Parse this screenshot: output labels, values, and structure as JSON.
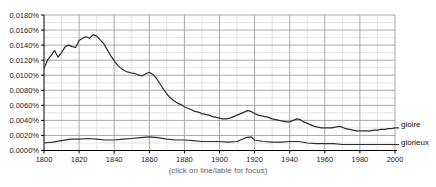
{
  "caption": "(click on line/lable for focus)",
  "chart_data": {
    "type": "line",
    "title": "",
    "xlabel": "",
    "ylabel": "",
    "legend_position": "right-of-lines",
    "grid": "major-and-minor",
    "x_axis": {
      "min": 1800,
      "max": 2000,
      "major_step": 20,
      "minor_step": 10,
      "tick_labels": [
        "1800",
        "1820",
        "1840",
        "1860",
        "1880",
        "1900",
        "1920",
        "1940",
        "1960",
        "1980",
        "2000"
      ]
    },
    "y_axis": {
      "min": 0.0,
      "max": 0.018,
      "major_step": 0.002,
      "minor_step": 0.001,
      "unit": "%",
      "tick_labels": [
        "0.0000%",
        "0.0020%",
        "0.0040%",
        "0.0060%",
        "0.0080%",
        "0.0100%",
        "0.0120%",
        "0.0140%",
        "0.0160%",
        "0.0180%"
      ]
    },
    "colors": {
      "line": "#2e2e2e",
      "major_grid": "#a8a8a8",
      "minor_grid": "#e4e4e4",
      "axis": "#000000",
      "tick_text": "#1a1a1a",
      "caption_text": "#666666"
    },
    "series": [
      {
        "name": "gloire",
        "points": [
          [
            1800,
            0.0109
          ],
          [
            1802,
            0.012
          ],
          [
            1804,
            0.0126
          ],
          [
            1806,
            0.0133
          ],
          [
            1808,
            0.0124
          ],
          [
            1810,
            0.013
          ],
          [
            1812,
            0.0138
          ],
          [
            1814,
            0.014
          ],
          [
            1816,
            0.0138
          ],
          [
            1818,
            0.0137
          ],
          [
            1820,
            0.0146
          ],
          [
            1822,
            0.0149
          ],
          [
            1824,
            0.0151
          ],
          [
            1826,
            0.0149
          ],
          [
            1828,
            0.0154
          ],
          [
            1830,
            0.0152
          ],
          [
            1832,
            0.0147
          ],
          [
            1834,
            0.0142
          ],
          [
            1836,
            0.0134
          ],
          [
            1838,
            0.0126
          ],
          [
            1840,
            0.0119
          ],
          [
            1842,
            0.0113
          ],
          [
            1844,
            0.0109
          ],
          [
            1846,
            0.0106
          ],
          [
            1848,
            0.0104
          ],
          [
            1850,
            0.0103
          ],
          [
            1852,
            0.0102
          ],
          [
            1854,
            0.01
          ],
          [
            1856,
            0.0099
          ],
          [
            1858,
            0.0102
          ],
          [
            1860,
            0.0104
          ],
          [
            1862,
            0.0101
          ],
          [
            1864,
            0.0096
          ],
          [
            1866,
            0.0089
          ],
          [
            1868,
            0.0082
          ],
          [
            1870,
            0.0075
          ],
          [
            1872,
            0.007
          ],
          [
            1874,
            0.0066
          ],
          [
            1876,
            0.0063
          ],
          [
            1878,
            0.0061
          ],
          [
            1880,
            0.0058
          ],
          [
            1882,
            0.0056
          ],
          [
            1884,
            0.0054
          ],
          [
            1886,
            0.0052
          ],
          [
            1888,
            0.0051
          ],
          [
            1890,
            0.0049
          ],
          [
            1892,
            0.0048
          ],
          [
            1894,
            0.0047
          ],
          [
            1896,
            0.0045
          ],
          [
            1898,
            0.0044
          ],
          [
            1900,
            0.0043
          ],
          [
            1902,
            0.0042
          ],
          [
            1904,
            0.0042
          ],
          [
            1906,
            0.0043
          ],
          [
            1908,
            0.0045
          ],
          [
            1910,
            0.0047
          ],
          [
            1912,
            0.0049
          ],
          [
            1914,
            0.0051
          ],
          [
            1916,
            0.0053
          ],
          [
            1918,
            0.0052
          ],
          [
            1920,
            0.0049
          ],
          [
            1922,
            0.0047
          ],
          [
            1924,
            0.0046
          ],
          [
            1926,
            0.0045
          ],
          [
            1928,
            0.0044
          ],
          [
            1930,
            0.0042
          ],
          [
            1932,
            0.0041
          ],
          [
            1934,
            0.004
          ],
          [
            1936,
            0.0039
          ],
          [
            1938,
            0.0038
          ],
          [
            1940,
            0.0038
          ],
          [
            1942,
            0.004
          ],
          [
            1944,
            0.0042
          ],
          [
            1946,
            0.0041
          ],
          [
            1948,
            0.0038
          ],
          [
            1950,
            0.0036
          ],
          [
            1952,
            0.0034
          ],
          [
            1954,
            0.0032
          ],
          [
            1956,
            0.0031
          ],
          [
            1958,
            0.003
          ],
          [
            1960,
            0.003
          ],
          [
            1962,
            0.003
          ],
          [
            1964,
            0.003
          ],
          [
            1966,
            0.0031
          ],
          [
            1968,
            0.0032
          ],
          [
            1970,
            0.0031
          ],
          [
            1972,
            0.0029
          ],
          [
            1974,
            0.0028
          ],
          [
            1976,
            0.0027
          ],
          [
            1978,
            0.0026
          ],
          [
            1980,
            0.0026
          ],
          [
            1982,
            0.0026
          ],
          [
            1984,
            0.0026
          ],
          [
            1986,
            0.0026
          ],
          [
            1988,
            0.0027
          ],
          [
            1990,
            0.0027
          ],
          [
            1992,
            0.0028
          ],
          [
            1994,
            0.0028
          ],
          [
            1996,
            0.0029
          ],
          [
            1998,
            0.0029
          ],
          [
            2000,
            0.003
          ]
        ]
      },
      {
        "name": "glorieux",
        "points": [
          [
            1800,
            0.001
          ],
          [
            1805,
            0.0011
          ],
          [
            1810,
            0.0013
          ],
          [
            1815,
            0.0015
          ],
          [
            1820,
            0.0015
          ],
          [
            1825,
            0.0016
          ],
          [
            1830,
            0.0015
          ],
          [
            1835,
            0.0014
          ],
          [
            1840,
            0.0014
          ],
          [
            1845,
            0.0015
          ],
          [
            1850,
            0.0016
          ],
          [
            1855,
            0.0017
          ],
          [
            1860,
            0.0018
          ],
          [
            1865,
            0.0017
          ],
          [
            1870,
            0.0015
          ],
          [
            1875,
            0.0014
          ],
          [
            1880,
            0.0014
          ],
          [
            1885,
            0.0013
          ],
          [
            1890,
            0.0012
          ],
          [
            1895,
            0.0012
          ],
          [
            1900,
            0.0012
          ],
          [
            1905,
            0.0011
          ],
          [
            1910,
            0.0012
          ],
          [
            1915,
            0.0017
          ],
          [
            1918,
            0.0018
          ],
          [
            1920,
            0.0014
          ],
          [
            1925,
            0.0012
          ],
          [
            1930,
            0.0011
          ],
          [
            1935,
            0.0011
          ],
          [
            1940,
            0.0012
          ],
          [
            1945,
            0.0012
          ],
          [
            1950,
            0.001
          ],
          [
            1955,
            0.0009
          ],
          [
            1960,
            0.0009
          ],
          [
            1965,
            0.0009
          ],
          [
            1970,
            0.0008
          ],
          [
            1975,
            0.0008
          ],
          [
            1980,
            0.0008
          ],
          [
            1985,
            0.0008
          ],
          [
            1990,
            0.0008
          ],
          [
            1995,
            0.0008
          ],
          [
            2000,
            0.0008
          ]
        ]
      }
    ]
  },
  "series_labels": {
    "gloire": "gloire",
    "glorieux": "glorieux"
  }
}
